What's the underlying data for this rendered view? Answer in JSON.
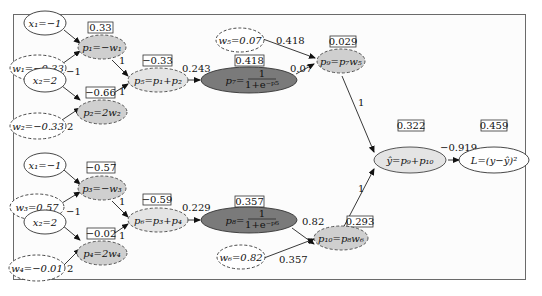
{
  "diagram": {
    "colors": {
      "input_fill": "#ffffff",
      "weight_fill": "#ffffff",
      "op_fill": "#cfcfcf",
      "sigmoid_fill": "#7a7a7a",
      "sum_fill": "#e4e4e4",
      "border": "#333333"
    },
    "nodes": {
      "x1_top": {
        "label": "x₁=−1"
      },
      "w1": {
        "label": "w₁=−0.33"
      },
      "x2_top": {
        "label": "x₂=2"
      },
      "w2": {
        "label": "w₂=−0.33"
      },
      "p1": {
        "label": "p₁=−w₁",
        "value": "0.33"
      },
      "p2": {
        "label": "p₂=2w₂",
        "value": "−0.66"
      },
      "p5": {
        "label": "p₅=p₁+p₂",
        "value": "−0.33"
      },
      "p7": {
        "label": "p₇=",
        "frac_num": "1",
        "frac_den": "1+e⁻ᵖ⁵",
        "value": "0.418"
      },
      "w5": {
        "label": "w₅=0.07"
      },
      "p9": {
        "label": "p₉=p₇w₅",
        "value": "0.029"
      },
      "x1_bot": {
        "label": "x₁=−1"
      },
      "w3": {
        "label": "w₃=0.57"
      },
      "x2_bot": {
        "label": "x₂=2"
      },
      "w4": {
        "label": "w₄=−0.01"
      },
      "p3": {
        "label": "p₃=−w₃",
        "value": "−0.57"
      },
      "p4": {
        "label": "p₄=2w₄",
        "value": "−0.02"
      },
      "p6": {
        "label": "p₆=p₃+p₄",
        "value": "−0.59"
      },
      "p8": {
        "label": "p₈=",
        "frac_num": "1",
        "frac_den": "1+e⁻ᵖ⁶",
        "value": "0.357"
      },
      "w6": {
        "label": "w₆=0.82"
      },
      "p10": {
        "label": "p₁₀=p₈w₆",
        "value": "0.293"
      },
      "yhat": {
        "label": "ŷ=p₉+p₁₀",
        "value": "0.322"
      },
      "loss": {
        "label": "L=(y−ŷ)²",
        "value": "0.459"
      }
    },
    "edge_labels": {
      "w1_p1": "−1",
      "p1_p5": "1",
      "p2_p5": "1",
      "w2_p2": "2",
      "p5_p7": "0.243",
      "w5_p9": "0.418",
      "p7_p9": "0.07",
      "p9_yhat": "1",
      "yhat_loss": "−0.919",
      "w3_p3": "−1",
      "p3_p6": "1",
      "p4_p6": "1",
      "w4_p4": "2",
      "p6_p8": "0.229",
      "p8_p10": "0.82",
      "w6_p10": "0.357",
      "p10_yhat": "1"
    }
  }
}
